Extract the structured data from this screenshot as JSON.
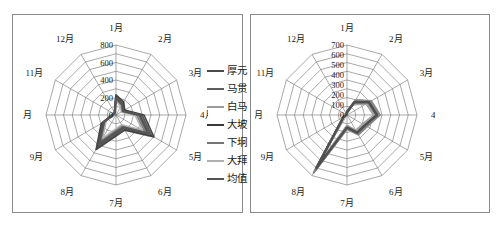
{
  "chart_data": [
    {
      "panel": "left",
      "type": "line",
      "subtype": "radar",
      "title": "",
      "xlabel": "",
      "ylabel": "",
      "grid": true,
      "legend_position": "right",
      "categories": [
        "1月",
        "2月",
        "3月",
        "4月",
        "5月",
        "6月",
        "7月",
        "8月",
        "9月",
        "10月",
        "11月",
        "12月"
      ],
      "rtick_labels": [
        "0",
        "200",
        "400",
        "600",
        "800"
      ],
      "rlim": [
        0,
        800
      ],
      "rings": 8,
      "series": [
        {
          "name": "厚元",
          "color": "#4a4a4a",
          "values": [
            205,
            150,
            95,
            300,
            470,
            175,
            225,
            410,
            180,
            40,
            28,
            30
          ]
        },
        {
          "name": "马贯",
          "color": "#5d5d5d",
          "values": [
            215,
            165,
            105,
            285,
            455,
            190,
            215,
            430,
            170,
            45,
            30,
            32
          ]
        },
        {
          "name": "白马",
          "color": "#9a9a9a",
          "values": [
            190,
            130,
            85,
            250,
            400,
            150,
            185,
            360,
            150,
            35,
            25,
            26
          ]
        },
        {
          "name": "大坡",
          "color": "#3a3a3a",
          "values": [
            230,
            175,
            115,
            320,
            500,
            200,
            240,
            455,
            195,
            50,
            33,
            35
          ]
        },
        {
          "name": "下坰",
          "color": "#757575",
          "values": [
            175,
            120,
            78,
            235,
            380,
            140,
            170,
            335,
            140,
            32,
            22,
            24
          ]
        },
        {
          "name": "大拜",
          "color": "#b0b0b0",
          "values": [
            160,
            110,
            70,
            215,
            350,
            128,
            155,
            305,
            128,
            28,
            20,
            22
          ]
        },
        {
          "name": "均值",
          "color": "#555555",
          "values": [
            196,
            142,
            91,
            268,
            426,
            164,
            198,
            383,
            161,
            38,
            26,
            28
          ]
        }
      ]
    },
    {
      "panel": "right",
      "type": "line",
      "subtype": "radar",
      "title": "",
      "xlabel": "",
      "ylabel": "",
      "grid": true,
      "legend_position": "right",
      "categories": [
        "1月",
        "2月",
        "3月",
        "4月",
        "5月",
        "6月",
        "7月",
        "8月",
        "9月",
        "10月",
        "11月",
        "12月"
      ],
      "rtick_labels": [
        "0",
        "100",
        "200",
        "300",
        "400",
        "500",
        "600",
        "700"
      ],
      "rlim": [
        0,
        700
      ],
      "rings": 8,
      "series": [
        {
          "name": "P-6",
          "color": "#3d3d3d",
          "values": [
            30,
            150,
            255,
            300,
            210,
            205,
            125,
            620,
            40,
            10,
            8,
            10
          ]
        },
        {
          "name": "P-51",
          "color": "#4a4a4a",
          "values": [
            28,
            140,
            248,
            292,
            200,
            198,
            118,
            600,
            38,
            10,
            8,
            9
          ]
        },
        {
          "name": "P-52",
          "color": "#565656",
          "values": [
            32,
            158,
            262,
            310,
            216,
            212,
            130,
            635,
            42,
            11,
            9,
            10
          ]
        },
        {
          "name": "P-53",
          "color": "#626262",
          "values": [
            26,
            132,
            238,
            282,
            192,
            190,
            112,
            585,
            36,
            9,
            7,
            9
          ]
        },
        {
          "name": "P-54",
          "color": "#6e6e6e",
          "values": [
            34,
            164,
            270,
            318,
            222,
            218,
            134,
            648,
            44,
            11,
            9,
            11
          ]
        },
        {
          "name": "P-55",
          "color": "#7a7a7a",
          "values": [
            24,
            126,
            230,
            274,
            186,
            184,
            108,
            570,
            34,
            9,
            7,
            8
          ]
        },
        {
          "name": "P-56",
          "color": "#868686",
          "values": [
            36,
            170,
            276,
            326,
            228,
            224,
            138,
            660,
            46,
            12,
            10,
            11
          ]
        },
        {
          "name": "P-446",
          "color": "#929292",
          "values": [
            22,
            120,
            222,
            266,
            180,
            178,
            104,
            556,
            32,
            8,
            7,
            8
          ]
        },
        {
          "name": "P-435",
          "color": "#9e9e9e",
          "values": [
            38,
            176,
            282,
            332,
            234,
            230,
            142,
            672,
            48,
            12,
            10,
            12
          ]
        },
        {
          "name": "P-424",
          "color": "#5a5a5a",
          "values": [
            29,
            146,
            252,
            296,
            206,
            202,
            122,
            610,
            39,
            10,
            8,
            10
          ]
        },
        {
          "name": "P-413",
          "color": "#666666",
          "values": [
            31,
            154,
            258,
            304,
            212,
            208,
            128,
            628,
            41,
            11,
            9,
            10
          ]
        },
        {
          "name": "P-462",
          "color": "#727272",
          "values": [
            27,
            136,
            242,
            286,
            196,
            194,
            116,
            592,
            37,
            10,
            8,
            9
          ]
        },
        {
          "name": "P-451",
          "color": "#7e7e7e",
          "values": [
            33,
            160,
            266,
            314,
            218,
            214,
            132,
            640,
            43,
            11,
            9,
            11
          ]
        },
        {
          "name": "P-3246",
          "color": "#8a8a8a",
          "values": [
            25,
            128,
            234,
            278,
            188,
            186,
            110,
            576,
            35,
            9,
            7,
            9
          ]
        },
        {
          "name": "P-3135",
          "color": "#969696",
          "values": [
            35,
            168,
            274,
            322,
            226,
            222,
            136,
            654,
            45,
            12,
            10,
            11
          ]
        },
        {
          "name": "P-22461",
          "color": "#a8a8a8",
          "values": [
            23,
            122,
            226,
            270,
            182,
            180,
            106,
            562,
            33,
            8,
            7,
            8
          ]
        },
        {
          "name": "P-21356",
          "color": "#828282",
          "values": [
            37,
            172,
            278,
            328,
            230,
            226,
            140,
            666,
            47,
            12,
            10,
            12
          ]
        },
        {
          "name": "均值",
          "color": "#4f4f4f",
          "values": [
            30,
            148,
            254,
            300,
            208,
            204,
            124,
            614,
            40,
            10,
            8,
            10
          ]
        }
      ]
    }
  ],
  "panels": {
    "left": {
      "name": "radar-chart-left",
      "axis_labels": [
        "1月",
        "2月",
        "3月",
        "4月",
        "5月",
        "6月",
        "7月",
        "8月",
        "9月",
        "10月",
        "11月",
        "12月"
      ],
      "tick_labels": [
        "0",
        "200",
        "400",
        "600",
        "800"
      ],
      "legend": [
        {
          "label": "厚元",
          "color": "#4a4a4a"
        },
        {
          "label": "马贯",
          "color": "#5d5d5d"
        },
        {
          "label": "白马",
          "color": "#9a9a9a"
        },
        {
          "label": "大坡",
          "color": "#3a3a3a"
        },
        {
          "label": "下坰",
          "color": "#757575"
        },
        {
          "label": "大拜",
          "color": "#b0b0b0"
        },
        {
          "label": "均值",
          "color": "#555555"
        }
      ]
    },
    "right": {
      "name": "radar-chart-right",
      "axis_labels": [
        "1月",
        "2月",
        "3月",
        "4月",
        "5月",
        "6月",
        "7月",
        "8月",
        "9月",
        "10月",
        "11月",
        "12月"
      ],
      "tick_labels": [
        "0",
        "100",
        "200",
        "300",
        "400",
        "500",
        "600",
        "700"
      ],
      "legend": [
        {
          "label": "P-6",
          "color": "#3d3d3d"
        },
        {
          "label": "P-51",
          "color": "#4a4a4a"
        },
        {
          "label": "P-52",
          "color": "#565656"
        },
        {
          "label": "P-53",
          "color": "#626262"
        },
        {
          "label": "P-54",
          "color": "#6e6e6e"
        },
        {
          "label": "P-55",
          "color": "#7a7a7a"
        },
        {
          "label": "P-56",
          "color": "#868686"
        },
        {
          "label": "P-446",
          "color": "#929292"
        },
        {
          "label": "P-435",
          "color": "#9e9e9e"
        },
        {
          "label": "P-424",
          "color": "#5a5a5a"
        },
        {
          "label": "P-413",
          "color": "#666666"
        },
        {
          "label": "P-462",
          "color": "#727272"
        },
        {
          "label": "P-451",
          "color": "#7e7e7e"
        },
        {
          "label": "P-3246",
          "color": "#8a8a8a"
        },
        {
          "label": "P-3135",
          "color": "#969696"
        },
        {
          "label": "P-22461",
          "color": "#a8a8a8"
        },
        {
          "label": "P-21356",
          "color": "#828282"
        },
        {
          "label": "均值",
          "color": "#4f4f4f"
        }
      ]
    }
  }
}
